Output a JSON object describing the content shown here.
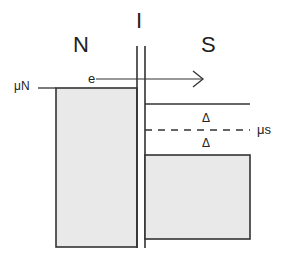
{
  "diagram": {
    "region_labels": {
      "normal": "N",
      "insulator": "I",
      "superconductor": "S"
    },
    "mu_n_label": "μN",
    "mu_s_label": "μs",
    "electron_label": "e",
    "gap_upper_label": "Δ",
    "gap_lower_label": "Δ",
    "colors": {
      "stroke": "#333333",
      "fill": "#e8e8e8",
      "background": "#ffffff"
    }
  }
}
